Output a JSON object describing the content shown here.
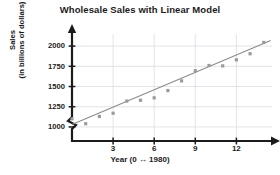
{
  "chart_data": {
    "type": "scatter",
    "title": "Wholesale Sales with Linear Model",
    "xlabel": "Year (0 ↔ 1980)",
    "ylabel_line1": "Sales",
    "ylabel_line2": "(in billions of dollars)",
    "ylabel": "Sales (in billions of dollars)",
    "xlim": [
      0,
      14.6
    ],
    "ylim": [
      950,
      2100
    ],
    "yticks": [
      1000,
      1250,
      1500,
      1750,
      2000
    ],
    "ytick_labels": [
      "1000",
      "1250",
      "1500",
      "1750",
      "2000"
    ],
    "xticks": [
      3,
      6,
      9,
      12
    ],
    "xtick_labels": [
      "3",
      "6",
      "9",
      "12"
    ],
    "grid": true,
    "grid_color": "#d9dde3",
    "axis_color": "#1b1b1b",
    "y_axis_break": true,
    "legend": null,
    "marker_color": "#9a9a9a",
    "line_color": "#8c8c8c",
    "x": [
      0,
      1,
      2,
      3,
      4,
      5,
      6,
      7,
      8,
      9,
      10,
      11,
      12,
      13,
      14
    ],
    "values": [
      1100,
      1040,
      1130,
      1170,
      1320,
      1330,
      1360,
      1450,
      1570,
      1695,
      1760,
      1755,
      1830,
      1905,
      2045
    ],
    "series": [
      {
        "name": "Wholesale sales",
        "type": "scatter",
        "x": [
          0,
          1,
          2,
          3,
          4,
          5,
          6,
          7,
          8,
          9,
          10,
          11,
          12,
          13,
          14
        ],
        "values": [
          1100,
          1040,
          1130,
          1170,
          1320,
          1330,
          1360,
          1450,
          1570,
          1695,
          1760,
          1755,
          1830,
          1905,
          2045
        ]
      },
      {
        "name": "Linear model",
        "type": "line",
        "x": [
          0,
          14.5
        ],
        "values": [
          1030,
          2070
        ],
        "slope": 71.7,
        "intercept": 1030
      }
    ]
  }
}
